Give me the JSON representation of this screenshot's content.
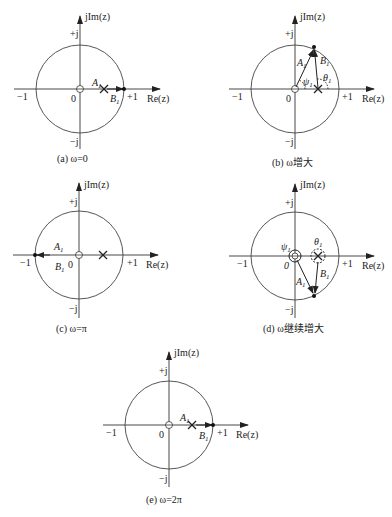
{
  "axis_labels": {
    "imag": "jIm(z)",
    "real": "Re(z)",
    "plus_j": "+j",
    "minus_j": "−j",
    "plus_one": "+1",
    "minus_one": "−1",
    "origin": "0"
  },
  "vector_labels": {
    "A": "A",
    "B": "B",
    "subscript": "1",
    "psi": "ψ",
    "theta": "θ"
  },
  "panels": [
    {
      "id": "a",
      "caption": "(a) ω=0",
      "description": "Point on unit circle at z=1; zero at origin, pole at z≈0.5 on real axis"
    },
    {
      "id": "b",
      "caption": "(b) ω增大",
      "description": "Point moves counter-clockwise on upper half of circle; angles ψ1 and θ1 shown"
    },
    {
      "id": "c",
      "caption": "(c) ω=π",
      "description": "Point at z=−1; vectors A1 and B1 point left"
    },
    {
      "id": "d",
      "caption": "(d) ω继续增大",
      "description": "Point continues into lower half of circle; angles ψ1 and θ1 drawn as circles around zero and pole"
    },
    {
      "id": "e",
      "caption": "(e) ω=2π",
      "description": "Point returns to z=1"
    }
  ],
  "elements": {
    "zero_marker": "zero-circle-at-origin",
    "pole_marker": "x-cross-pole",
    "point_marker": "filled-dot-on-unit-circle"
  }
}
